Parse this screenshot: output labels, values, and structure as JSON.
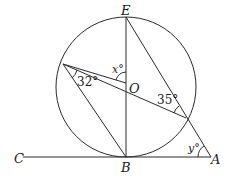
{
  "diagram": {
    "type": "circle-geometry",
    "points": {
      "E": "E",
      "O": "O",
      "B": "B",
      "A": "A",
      "C": "C"
    },
    "angles": {
      "x": "x°",
      "angle_32": "32°",
      "angle_35": "35°",
      "y": "y°"
    },
    "colors": {
      "stroke": "#2a2a2a",
      "background": "#ffffff"
    }
  }
}
